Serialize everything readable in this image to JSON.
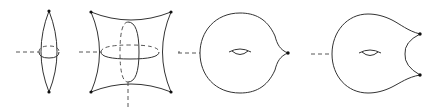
{
  "diagram": {
    "type": "surface-degenerations",
    "figures": [
      {
        "id": "lens",
        "description": "spindle/lens surface with two pinched points and a rotation axis",
        "marked_points": 2
      },
      {
        "id": "pillow",
        "description": "pillowcase surface with four corner points, horizontal and vertical cross-section circles",
        "marked_points": 4
      },
      {
        "id": "torus-one-cusp",
        "description": "torus with one cone point",
        "marked_points": 1
      },
      {
        "id": "torus-two-cusps",
        "description": "torus with two cone points joined by a concave boundary",
        "marked_points": 2
      }
    ],
    "colors": {
      "stroke": "#333333",
      "point": "#111111",
      "background": "#ffffff"
    }
  }
}
